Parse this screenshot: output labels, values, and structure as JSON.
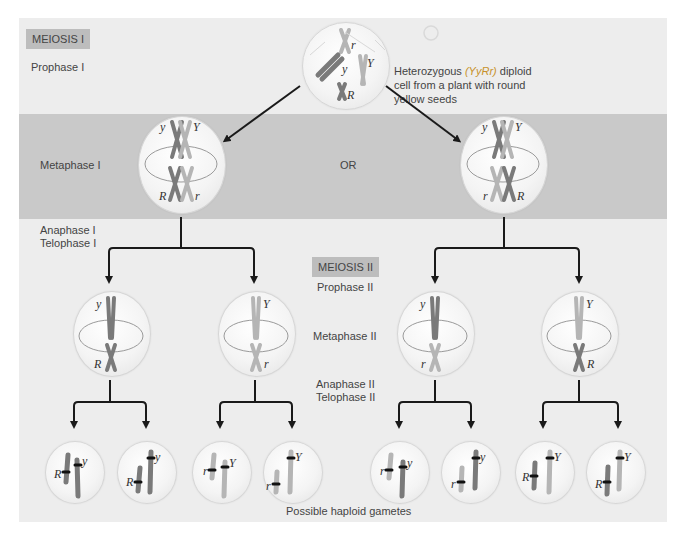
{
  "figure": {
    "meiosis1_tag": "MEIOSIS I",
    "meiosis2_tag": "MEIOSIS II",
    "stages": {
      "prophase1": "Prophase I",
      "metaphase1": "Metaphase I",
      "anaphase1": "Anaphase I",
      "telophase1": "Telophase I",
      "prophase2": "Prophase II",
      "metaphase2": "Metaphase II",
      "anaphase2": "Anaphase II",
      "telophase2": "Telophase II"
    },
    "parent_caption": {
      "line1_prefix": "Heterozygous ",
      "line1_genotype": "(YyRr)",
      "line1_suffix": " diploid",
      "line2": "cell from a plant with round",
      "line3": "yellow seeds"
    },
    "or_label": "OR",
    "gametes_caption": "Possible haploid gametes",
    "alleles": {
      "y": "y",
      "Y": "Y",
      "r": "r",
      "R": "R"
    },
    "metaphase1_arrangements": [
      {
        "top_left": "y",
        "top_right": "Y",
        "bottom_left": "R",
        "bottom_right": "r"
      },
      {
        "top_left": "y",
        "top_right": "Y",
        "bottom_left": "r",
        "bottom_right": "R"
      }
    ],
    "metaphase2_cells": [
      {
        "top": "y",
        "bottom": "R"
      },
      {
        "top": "Y",
        "bottom": "r"
      },
      {
        "top": "y",
        "bottom": "r"
      },
      {
        "top": "Y",
        "bottom": "R"
      }
    ],
    "gametes": [
      {
        "a": "R",
        "b": "y"
      },
      {
        "a": "R",
        "b": "y"
      },
      {
        "a": "r",
        "b": "Y"
      },
      {
        "a": "r",
        "b": "Y"
      },
      {
        "a": "r",
        "b": "y"
      },
      {
        "a": "r",
        "b": "y"
      },
      {
        "a": "R",
        "b": "Y"
      },
      {
        "a": "R",
        "b": "Y"
      }
    ],
    "colors": {
      "panel_bg": "#ededed",
      "band_bg": "#c9c9c9",
      "tag_bg": "#bdbdbd",
      "chromosome_dark": "#7a7a7a",
      "chromosome_light": "#b5b5b5",
      "arrow": "#1a1a1a"
    }
  }
}
